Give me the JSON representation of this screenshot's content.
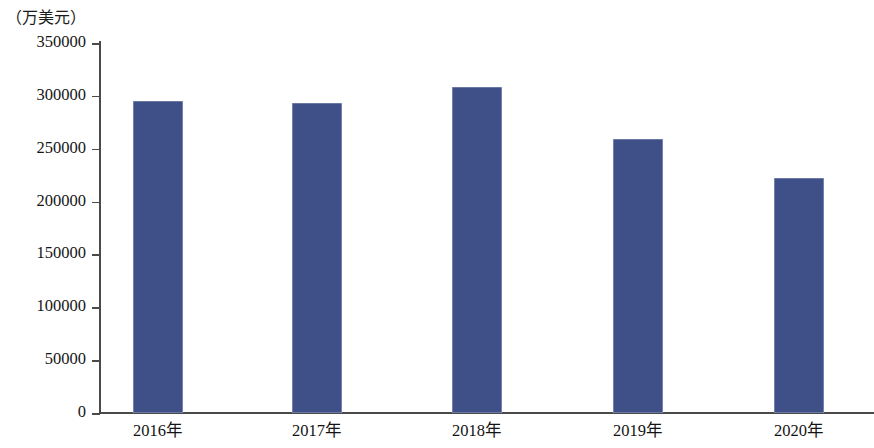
{
  "chart_data": {
    "type": "bar",
    "title": "",
    "subtitle": "",
    "unit_label": "（万美元）",
    "xlabel": "",
    "ylabel": "",
    "categories": [
      "2016年",
      "2017年",
      "2018年",
      "2019年",
      "2020年"
    ],
    "values": [
      295000,
      293000,
      308000,
      259000,
      222000
    ],
    "series": [
      {
        "name": "",
        "values": [
          295000,
          293000,
          308000,
          259000,
          222000
        ]
      }
    ],
    "ylim": [
      0,
      350000
    ],
    "ytick_labels": [
      "0",
      "50000",
      "100000",
      "150000",
      "200000",
      "250000",
      "300000",
      "350000"
    ],
    "ytick_values": [
      0,
      50000,
      100000,
      150000,
      200000,
      250000,
      300000,
      350000
    ],
    "grid": false,
    "legend": null,
    "legend_position": "none",
    "bar_color": "#3f5089",
    "axis_color": "#4a4a4a",
    "background_color": "#ffffff"
  }
}
